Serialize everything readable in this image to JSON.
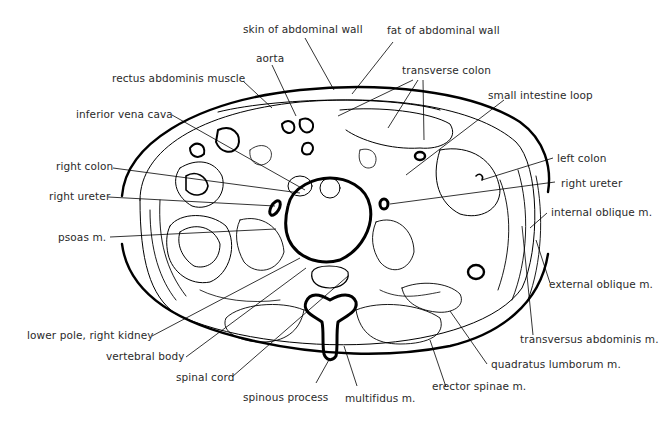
{
  "figure": {
    "line_color": "#000000",
    "label_color": "#2a2a2a",
    "background": "#ffffff"
  },
  "labels": {
    "skin": "skin of abdominal wall",
    "fat": "fat of abdominal wall",
    "aorta": "aorta",
    "rectus": "rectus abdominis muscle",
    "transverse_colon": "transverse colon",
    "small_intestine": "small intestine loop",
    "ivc": "inferior vena cava",
    "right_colon": "right colon",
    "left_colon": "left colon",
    "right_ureter_left": "right ureter",
    "right_ureter_right": "right ureter",
    "internal_oblique": "internal oblique m.",
    "psoas": "psoas m.",
    "external_oblique": "external oblique m.",
    "lower_pole_kidney": "lower pole, right kidney",
    "transversus": "transversus abdominis m.",
    "vertebral_body": "vertebral body",
    "quadratus": "quadratus lumborum m.",
    "spinal_cord": "spinal cord",
    "erector": "erector spinae m.",
    "spinous_process": "spinous process",
    "multifidus": "multifidus m."
  }
}
